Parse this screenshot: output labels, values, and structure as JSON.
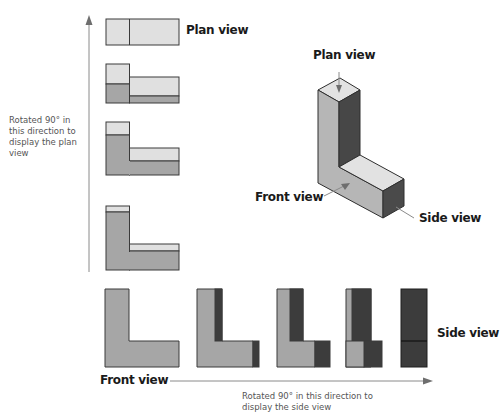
{
  "labels": {
    "plan_view_top": "Plan view",
    "plan_view_iso": "Plan view",
    "front_view_iso": "Front view",
    "side_view_iso": "Side view",
    "side_view_bottom": "Side view",
    "front_view_bottom": "Front view",
    "rotate_plan_note": "Rotated 90° in this direction to display the plan view",
    "rotate_side_note": "Rotated 90° in this direction to display the side view"
  },
  "colors": {
    "light_face": "#e0e0e0",
    "mid_face": "#a6a6a6",
    "dark_face": "#3c3c3c",
    "outline": "#3a3a3a",
    "arrow": "#8a8a8a",
    "text": "#1a1a1a",
    "note_text": "#555555"
  },
  "diagram": {
    "left_sequence": [
      "Plan view",
      "rotation step 2",
      "rotation step 3",
      "rotation step 4 (near front)"
    ],
    "bottom_sequence": [
      "Front view",
      "rotation step 2",
      "rotation step 3",
      "rotation step 4",
      "Side view"
    ],
    "isometric_object": "L-shaped solid block"
  }
}
